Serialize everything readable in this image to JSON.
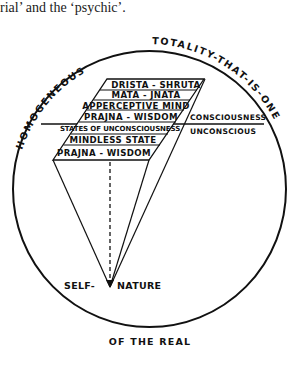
{
  "caption": {
    "text": "rial’ and the ‘psychic’."
  },
  "circle": {
    "arc_labels": {
      "upper_left": "HOMOGENEOUS",
      "upper_right": "TOTALITY-THAT-IS-ONE",
      "bottom": "OF THE REAL"
    }
  },
  "stack": {
    "rows": [
      {
        "label": "DRISTA - SHRUTA"
      },
      {
        "label": "MATA - JNATA"
      },
      {
        "label": "APPERCEPTIVE MIND"
      },
      {
        "label": "PRAJNA - WISDOM"
      },
      {
        "label": "STATES OF UNCONSCIOUSNESS"
      },
      {
        "label": "MINDLESS STATE"
      },
      {
        "label": "PRAJNA - WISDOM"
      }
    ]
  },
  "divider": {
    "above_label": "CONSCIOUSNESS",
    "below_label": "UNCONSCIOUS"
  },
  "apex": {
    "left_label": "SELF-",
    "right_label": "NATURE"
  },
  "colors": {
    "ink": "#111111",
    "paper": "#ffffff"
  }
}
